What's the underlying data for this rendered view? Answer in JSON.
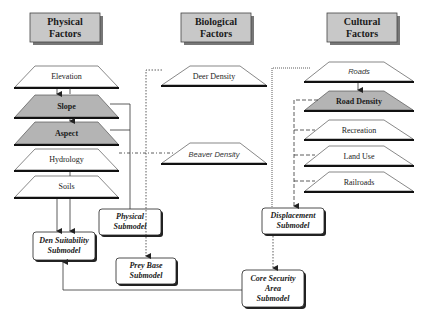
{
  "headers": {
    "physical": {
      "line1": "Physical",
      "line2": "Factors"
    },
    "biological": {
      "line1": "Biological",
      "line2": "Factors"
    },
    "cultural": {
      "line1": "Cultural",
      "line2": "Factors"
    }
  },
  "physical_layers": [
    {
      "label": "Elevation",
      "shaded": false
    },
    {
      "label": "Slope",
      "shaded": true
    },
    {
      "label": "Aspect",
      "shaded": true
    },
    {
      "label": "Hydrology",
      "shaded": false
    },
    {
      "label": "Soils",
      "shaded": false
    }
  ],
  "biological_layers": [
    {
      "label": "Deer Density",
      "shaded": false
    },
    {
      "label": "Beaver Density",
      "shaded": false,
      "italic": true
    }
  ],
  "cultural_layers": [
    {
      "label": "Roads",
      "shaded": false,
      "italic": true
    },
    {
      "label": "Road Density",
      "shaded": true
    },
    {
      "label": "Recreation",
      "shaded": false
    },
    {
      "label": "Land Use",
      "shaded": false
    },
    {
      "label": "Railroads",
      "shaded": false
    }
  ],
  "submodels": {
    "den_suitability": {
      "line1": "Den Suitability",
      "line2": "Submodel"
    },
    "physical": {
      "line1": "Physical",
      "line2": "Submodel"
    },
    "prey_base": {
      "line1": "Prey Base",
      "line2": "Submodel"
    },
    "displacement": {
      "line1": "Displacement",
      "line2": "Submodel"
    },
    "core_security": {
      "line1": "Core Security",
      "line2": "Area",
      "line3": "Submodel"
    }
  },
  "colors": {
    "header_fill": "#c8c8c8",
    "shaded_layer_fill": "#b4b4b4",
    "layer_fill": "#ffffff",
    "line": "#333333"
  }
}
